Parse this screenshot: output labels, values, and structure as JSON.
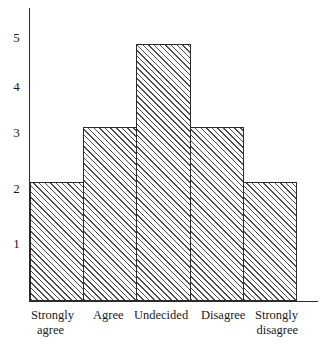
{
  "chart_data": {
    "type": "bar",
    "title": "",
    "subtitle": "",
    "xlabel": "",
    "ylabel": "",
    "categories": [
      "Strongly agree",
      "Agree",
      "Undecided",
      "Disagree",
      "Strongly disagree"
    ],
    "category_lines": [
      [
        "Strongly",
        "agree"
      ],
      [
        "Agree",
        ""
      ],
      [
        "Undecided",
        ""
      ],
      [
        "Disagree",
        ""
      ],
      [
        "Strongly",
        "disagree"
      ]
    ],
    "values": [
      2.15,
      3.15,
      4.65,
      3.15,
      2.15
    ],
    "ylim": [
      0,
      5.3
    ],
    "yticks": [
      1,
      2,
      3,
      4,
      5
    ],
    "ytick_labels": [
      "1",
      "2",
      "3",
      "4",
      "5"
    ],
    "grid": false,
    "legend": false,
    "legend_position": "none",
    "bar_fill": "hatched-diagonal",
    "bar_edge_color": "#2b2b2b",
    "bar_hatch_color": "#4d4d4d",
    "axis_color": "#2b2b2b",
    "background_color": "#ffffff",
    "bars_contiguous": true
  },
  "axis": {
    "y_tick_1": "1",
    "y_tick_2": "2",
    "y_tick_3": "3",
    "y_tick_4": "4",
    "y_tick_5": "5"
  },
  "labels": {
    "cat0_line1": "Strongly",
    "cat0_line2": "agree",
    "cat1_line1": "Agree",
    "cat2_line1": "Undecided",
    "cat3_line1": "Disagree",
    "cat4_line1": "Strongly",
    "cat4_line2": "disagree"
  }
}
